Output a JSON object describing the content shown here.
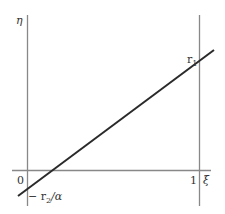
{
  "diagram": {
    "y_axis_label": "η",
    "x_axis_label": "ξ",
    "origin_label": "0",
    "x_one_label": "1",
    "line_top_label_main": "r",
    "line_top_label_sub": "1",
    "intercept_label_prefix": "− r",
    "intercept_label_sub": "2",
    "intercept_label_suffix": "/α"
  },
  "colors": {
    "axis": "#888888",
    "line": "#2a2a2a",
    "text": "#333333"
  }
}
